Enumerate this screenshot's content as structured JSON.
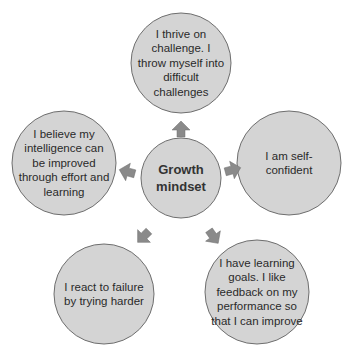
{
  "diagram": {
    "title": "Growth mindset",
    "colors": {
      "circle_fill": "#d4d4d4",
      "circle_stroke": "#6e6e6e",
      "arrow_fill": "#8a8a8a",
      "text": "#2a2a2a"
    },
    "center": {
      "label": "Growth mindset",
      "line1": "Growth",
      "line2": "mindset"
    },
    "nodes": [
      {
        "position": "top",
        "text": "I thrive on challenge. I throw myself into difficult challenges"
      },
      {
        "position": "right",
        "text": "I am self-confident"
      },
      {
        "position": "bottom-right",
        "text": "I have learning goals. I like feedback on my performance so that I can improve"
      },
      {
        "position": "bottom-left",
        "text": "I react to failure by trying harder"
      },
      {
        "position": "left",
        "text": "I believe my intelligence can be improved through effort and learning"
      }
    ]
  }
}
